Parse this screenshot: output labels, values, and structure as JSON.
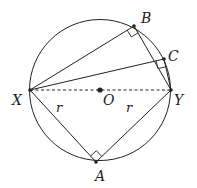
{
  "diagram": {
    "type": "geometry",
    "circle": {
      "center": "O",
      "cx": 100,
      "cy": 90,
      "r": 70
    },
    "points": {
      "X": {
        "label": "X",
        "x": 30,
        "y": 90
      },
      "Y": {
        "label": "Y",
        "x": 171,
        "y": 90
      },
      "O": {
        "label": "O",
        "x": 100,
        "y": 90
      },
      "A": {
        "label": "A",
        "x": 96,
        "y": 162
      },
      "B": {
        "label": "B",
        "x": 134,
        "y": 26
      },
      "C": {
        "label": "C",
        "x": 164,
        "y": 59
      }
    },
    "segments": [
      {
        "from": "X",
        "to": "B",
        "style": "solid"
      },
      {
        "from": "B",
        "to": "Y",
        "style": "solid"
      },
      {
        "from": "X",
        "to": "C",
        "style": "solid"
      },
      {
        "from": "C",
        "to": "Y",
        "style": "solid"
      },
      {
        "from": "X",
        "to": "A",
        "style": "solid"
      },
      {
        "from": "A",
        "to": "Y",
        "style": "solid"
      },
      {
        "from": "X",
        "to": "Y",
        "style": "dashed"
      }
    ],
    "right_angles": [
      "B",
      "C",
      "A"
    ],
    "side_labels": {
      "XA": "r",
      "AY": "r"
    },
    "colors": {
      "stroke": "#222222",
      "background": "#ffffff"
    }
  }
}
